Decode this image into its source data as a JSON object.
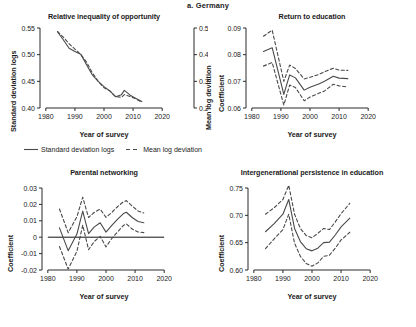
{
  "figure": {
    "title": "a. Germany",
    "legend": [
      {
        "label": "Standard deviation logs",
        "style": "solid",
        "icon": "solid-line-icon"
      },
      {
        "label": "Mean log deviation",
        "style": "dashed",
        "icon": "dashed-line-icon"
      }
    ],
    "line_color": "#4a4a4a",
    "axis_color": "#2b2b2b"
  },
  "chart_data": [
    {
      "type": "line",
      "panel": "relative-inequality-of-opportunity",
      "title": "Relative inequality of opportunity",
      "xlabel": "Year of survey",
      "ylabel": "Standard deviation logs",
      "y2label": "Mean log deviation",
      "xlim": [
        1978,
        2022
      ],
      "ylim": [
        0.4,
        0.55
      ],
      "y2lim": [
        0.2,
        0.5
      ],
      "xticks": [
        1980,
        1990,
        2000,
        2010,
        2020
      ],
      "yticks": [
        0.4,
        0.45,
        0.5,
        0.55
      ],
      "y2ticks": [
        0.2,
        0.3,
        0.4,
        0.5
      ],
      "grid": false,
      "legend_position": "below-top-row",
      "series": [
        {
          "name": "Standard deviation logs",
          "style": "solid",
          "x": [
            1984,
            1986,
            1988,
            1990,
            1992,
            1994,
            1996,
            1998,
            2000,
            2002,
            2004,
            2006,
            2007,
            2009,
            2011,
            2013
          ],
          "values": [
            0.543,
            0.528,
            0.512,
            0.506,
            0.501,
            0.481,
            0.462,
            0.45,
            0.44,
            0.432,
            0.421,
            0.425,
            0.433,
            0.424,
            0.418,
            0.412
          ]
        },
        {
          "name": "Mean log deviation",
          "style": "dashed",
          "axis": "right",
          "x": [
            1984,
            1986,
            1988,
            1990,
            1992,
            1994,
            1996,
            1998,
            2000,
            2002,
            2004,
            2006,
            2007,
            2009,
            2011,
            2013
          ],
          "values": [
            0.487,
            0.466,
            0.441,
            0.421,
            0.401,
            0.372,
            0.332,
            0.3,
            0.276,
            0.264,
            0.243,
            0.24,
            0.25,
            0.243,
            0.234,
            0.221
          ]
        }
      ]
    },
    {
      "type": "line",
      "panel": "return-to-education",
      "title": "Return to education",
      "xlabel": "Year of survey",
      "ylabel": "Coefficient",
      "xlim": [
        1978,
        2022
      ],
      "ylim": [
        0.06,
        0.09
      ],
      "xticks": [
        1980,
        1990,
        2000,
        2010,
        2020
      ],
      "yticks": [
        0.06,
        0.07,
        0.08,
        0.09
      ],
      "grid": false,
      "series": [
        {
          "name": "Estimate",
          "style": "solid",
          "x": [
            1984,
            1987,
            1991,
            1993,
            1995,
            1998,
            2000,
            2003,
            2005,
            2008,
            2010,
            2013
          ],
          "values": [
            0.0812,
            0.0826,
            0.0651,
            0.0724,
            0.0713,
            0.0667,
            0.0678,
            0.069,
            0.07,
            0.0719,
            0.0712,
            0.071
          ]
        },
        {
          "name": "Upper confidence bound",
          "style": "dashed",
          "x": [
            1984,
            1987,
            1991,
            1993,
            1995,
            1998,
            2000,
            2003,
            2005,
            2008,
            2010,
            2013
          ],
          "values": [
            0.0869,
            0.0892,
            0.07,
            0.0761,
            0.0748,
            0.0709,
            0.0715,
            0.0726,
            0.0736,
            0.0749,
            0.0742,
            0.0741
          ]
        },
        {
          "name": "Lower confidence bound",
          "style": "dashed",
          "x": [
            1984,
            1987,
            1991,
            1993,
            1995,
            1998,
            2000,
            2003,
            2005,
            2008,
            2010,
            2013
          ],
          "values": [
            0.0757,
            0.0771,
            0.0611,
            0.0686,
            0.0677,
            0.0627,
            0.0641,
            0.0655,
            0.0664,
            0.0689,
            0.0683,
            0.0679
          ]
        }
      ]
    },
    {
      "type": "line",
      "panel": "parental-networking",
      "title": "Parental networking",
      "xlabel": "Year of survey",
      "ylabel": "Coefficient",
      "xlim": [
        1978,
        2022
      ],
      "ylim": [
        -0.02,
        0.03
      ],
      "xticks": [
        1980,
        1990,
        2000,
        2010,
        2020
      ],
      "yticks": [
        -0.02,
        -0.01,
        0,
        0.01,
        0.02,
        0.03
      ],
      "zero_line": true,
      "grid": false,
      "series": [
        {
          "name": "Estimate",
          "style": "solid",
          "x": [
            1984,
            1987,
            1990,
            1992,
            1994,
            1996,
            1998,
            2000,
            2002,
            2004,
            2006,
            2007,
            2009,
            2011,
            2013
          ],
          "values": [
            0.0057,
            -0.0082,
            0.0019,
            0.0159,
            0.0022,
            0.0063,
            0.0088,
            0.0031,
            0.0072,
            0.011,
            0.0144,
            0.0152,
            0.012,
            0.0096,
            0.0088
          ]
        },
        {
          "name": "Upper confidence bound",
          "style": "dashed",
          "x": [
            1984,
            1987,
            1990,
            1992,
            1994,
            1996,
            1998,
            2000,
            2002,
            2004,
            2006,
            2007,
            2009,
            2011,
            2013
          ],
          "values": [
            0.0172,
            0.0028,
            0.0124,
            0.0244,
            0.012,
            0.0152,
            0.0171,
            0.0121,
            0.0151,
            0.0187,
            0.0216,
            0.0223,
            0.019,
            0.016,
            0.0148
          ]
        },
        {
          "name": "Lower confidence bound",
          "style": "dashed",
          "x": [
            1984,
            1987,
            1990,
            1992,
            1994,
            1996,
            1998,
            2000,
            2002,
            2004,
            2006,
            2007,
            2009,
            2011,
            2013
          ],
          "values": [
            -0.0057,
            -0.0194,
            -0.0086,
            0.0073,
            -0.0076,
            -0.0026,
            0.0005,
            -0.0059,
            -0.0008,
            0.0033,
            0.0072,
            0.0081,
            0.005,
            0.0032,
            0.0028
          ]
        }
      ]
    },
    {
      "type": "line",
      "panel": "intergenerational-persistence-in-education",
      "title": "Intergenerational persistence in education",
      "xlabel": "Year of survey",
      "ylabel": "Coefficient",
      "xlim": [
        1978,
        2022
      ],
      "ylim": [
        0.6,
        0.75
      ],
      "xticks": [
        1980,
        1990,
        2000,
        2010,
        2020
      ],
      "yticks": [
        0.6,
        0.65,
        0.7,
        0.75
      ],
      "grid": false,
      "series": [
        {
          "name": "Estimate",
          "style": "solid",
          "x": [
            1984,
            1987,
            1990,
            1992,
            1994,
            1996,
            1998,
            2000,
            2002,
            2004,
            2006,
            2008,
            2010,
            2013
          ],
          "values": [
            0.67,
            0.685,
            0.702,
            0.729,
            0.676,
            0.652,
            0.639,
            0.635,
            0.64,
            0.65,
            0.651,
            0.664,
            0.679,
            0.695
          ]
        },
        {
          "name": "Upper confidence bound",
          "style": "dashed",
          "x": [
            1984,
            1987,
            1990,
            1992,
            1994,
            1996,
            1998,
            2000,
            2002,
            2004,
            2006,
            2008,
            2010,
            2013
          ],
          "values": [
            0.702,
            0.714,
            0.729,
            0.755,
            0.702,
            0.676,
            0.663,
            0.659,
            0.667,
            0.676,
            0.674,
            0.688,
            0.703,
            0.722
          ]
        },
        {
          "name": "Lower confidence bound",
          "style": "dashed",
          "x": [
            1984,
            1987,
            1990,
            1992,
            1994,
            1996,
            1998,
            2000,
            2002,
            2004,
            2006,
            2008,
            2010,
            2013
          ],
          "values": [
            0.639,
            0.657,
            0.674,
            0.702,
            0.649,
            0.625,
            0.612,
            0.607,
            0.613,
            0.625,
            0.627,
            0.64,
            0.655,
            0.669
          ]
        }
      ]
    }
  ]
}
